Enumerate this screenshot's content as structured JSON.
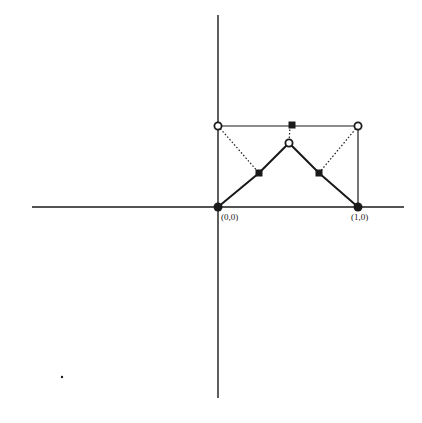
{
  "diagram": {
    "colors": {
      "background": "#ffffff",
      "ink": "#1a1a1a"
    },
    "axes": {
      "x_axis": {
        "x1": 32,
        "y1": 207,
        "x2": 404,
        "y2": 207
      },
      "y_axis": {
        "x1": 218,
        "y1": 15,
        "x2": 218,
        "y2": 398
      }
    },
    "labels": [
      {
        "id": "origin",
        "text": "(0,0)",
        "x": 221,
        "y": 220
      },
      {
        "id": "unit",
        "text": "(1,0)",
        "x": 351,
        "y": 220
      }
    ],
    "rectangle": {
      "top_left": [
        218,
        126
      ],
      "top_right": [
        358,
        126
      ],
      "bottom_left": [
        218,
        207
      ],
      "bottom_right": [
        358,
        207
      ]
    },
    "solid_path": [
      [
        218,
        207
      ],
      [
        259,
        173
      ],
      [
        289,
        143
      ],
      [
        319,
        173
      ],
      [
        358,
        207
      ]
    ],
    "dotted_segments": [
      {
        "from": [
          218,
          126
        ],
        "to": [
          259,
          173
        ]
      },
      {
        "from": [
          358,
          126
        ],
        "to": [
          319,
          173
        ]
      },
      {
        "from": [
          290,
          126
        ],
        "to": [
          289,
          143
        ]
      }
    ],
    "open_circles": [
      [
        218,
        126
      ],
      [
        358,
        126
      ],
      [
        289,
        143
      ]
    ],
    "filled_circles": [
      [
        218,
        207
      ],
      [
        358,
        207
      ]
    ],
    "filled_squares": [
      [
        292,
        125
      ],
      [
        259,
        173
      ],
      [
        319,
        173
      ]
    ],
    "speck": [
      62,
      377
    ]
  }
}
